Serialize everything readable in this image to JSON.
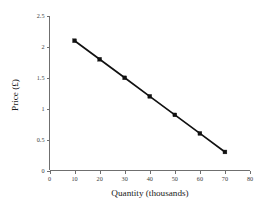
{
  "chart_data": {
    "type": "line",
    "title": "",
    "xlabel": "Quantity (thousands)",
    "ylabel": "Price (£)",
    "x": [
      10,
      20,
      30,
      40,
      50,
      60,
      70
    ],
    "values": [
      2.1,
      1.8,
      1.5,
      1.2,
      0.9,
      0.6,
      0.3
    ],
    "series": [
      {
        "name": "Demand",
        "x": [
          10,
          20,
          30,
          40,
          50,
          60,
          70
        ],
        "values": [
          2.1,
          1.8,
          1.5,
          1.2,
          0.9,
          0.6,
          0.3
        ]
      }
    ],
    "xlim": [
      0,
      80
    ],
    "ylim": [
      0,
      2.5
    ],
    "xticks": [
      0,
      10,
      20,
      30,
      40,
      50,
      60,
      70,
      80
    ],
    "xtick_labels": [
      "0",
      "10",
      "20",
      "30",
      "40",
      "50",
      "60",
      "70",
      "80"
    ],
    "yticks": [
      0,
      0.5,
      1,
      1.5,
      2,
      2.5
    ],
    "ytick_labels": [
      "0",
      "0.5",
      "1",
      "1.5",
      "2",
      "2.5"
    ],
    "grid": false,
    "legend": false,
    "marker": "square",
    "line_color": "#111111",
    "axis_color": "#6f6f6f",
    "background_color": "#ffffff"
  }
}
